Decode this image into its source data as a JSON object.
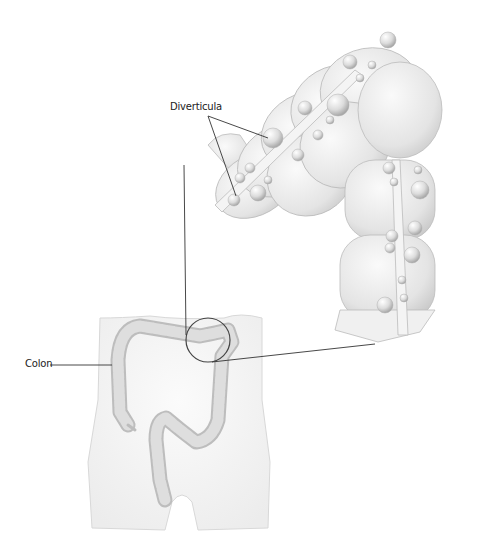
{
  "figure": {
    "labels": {
      "diverticula": "Diverticula",
      "colon": "Colon"
    },
    "colors": {
      "background": "#ffffff",
      "colon_fill": "#e2e2e2",
      "colon_shade": "#c4c4c4",
      "torso_fill": "#f4f4f4",
      "leader_line": "#333333"
    }
  }
}
